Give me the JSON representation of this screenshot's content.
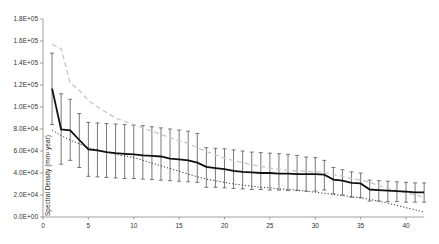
{
  "chart_data": {
    "type": "line",
    "title": "",
    "xlabel": "",
    "ylabel": "Spectral Density (mm² year)",
    "xlim": [
      0,
      42
    ],
    "ylim": [
      0,
      180000
    ],
    "grid": false,
    "legend": null,
    "x_ticks": [
      "0",
      "5",
      "10",
      "15",
      "20",
      "25",
      "30",
      "35",
      "40"
    ],
    "x_tick_values": [
      0,
      5,
      10,
      15,
      20,
      25,
      30,
      35,
      40
    ],
    "y_ticks": [
      "0.0E+00",
      "2.0E+04",
      "4.0E+04",
      "6.0E+04",
      "8.0E+04",
      "1.0E+05",
      "1.2E+05",
      "1.4E+05",
      "1.6E+05",
      "1.8E+05"
    ],
    "y_tick_values": [
      0,
      20000,
      40000,
      60000,
      80000,
      100000,
      120000,
      140000,
      160000,
      180000
    ],
    "x": [
      1,
      2,
      3,
      4,
      5,
      6,
      7,
      8,
      9,
      10,
      11,
      12,
      13,
      14,
      15,
      16,
      17,
      18,
      19,
      20,
      21,
      22,
      23,
      24,
      25,
      26,
      27,
      28,
      29,
      30,
      31,
      32,
      33,
      34,
      35,
      36,
      37,
      38,
      39,
      40,
      41,
      42
    ],
    "series": [
      {
        "name": "mean",
        "style": "solid-black-with-error-bars",
        "values": [
          116700,
          79600,
          78700,
          70000,
          61500,
          60500,
          59000,
          58000,
          57500,
          57000,
          56000,
          55500,
          55000,
          53000,
          52500,
          51500,
          49500,
          45500,
          44500,
          43500,
          42000,
          41000,
          40500,
          40000,
          40000,
          39500,
          39500,
          39000,
          39000,
          39000,
          38500,
          34000,
          33000,
          31000,
          30500,
          25000,
          24500,
          24000,
          23500,
          23000,
          22500,
          22500
        ]
      },
      {
        "name": "upper-bound",
        "style": "dashed-gray",
        "values": [
          157000,
          153000,
          122000,
          115000,
          106000,
          100000,
          95000,
          90000,
          87000,
          84000,
          81000,
          78000,
          75000,
          72000,
          69500,
          67000,
          63000,
          59500,
          56500,
          53500,
          51500,
          49500,
          47500,
          46000,
          44500,
          43500,
          42500,
          42000,
          41500,
          41000,
          40500,
          38500,
          37000,
          35000,
          33500,
          31500,
          28500,
          26000,
          24000,
          22000,
          20000,
          18000
        ]
      },
      {
        "name": "lower-bound",
        "style": "dotted-black",
        "values": [
          79000,
          74000,
          70000,
          66500,
          63000,
          61000,
          59000,
          57000,
          55500,
          54000,
          51500,
          49000,
          46500,
          44000,
          41500,
          39000,
          36500,
          34500,
          33000,
          31500,
          30000,
          29000,
          28000,
          27000,
          26500,
          25500,
          25000,
          24500,
          23500,
          22500,
          21500,
          20500,
          19500,
          18500,
          17500,
          16000,
          14500,
          12500,
          10500,
          8500,
          6500,
          4500
        ]
      },
      {
        "name": "error-bar-top",
        "values": [
          149000,
          112000,
          107000,
          94000,
          86000,
          85500,
          85000,
          84500,
          84000,
          83500,
          83000,
          82000,
          81000,
          80000,
          79000,
          78000,
          76000,
          63000,
          62500,
          62000,
          61000,
          60000,
          59000,
          58500,
          58000,
          57500,
          57000,
          56000,
          54500,
          54000,
          51500,
          45000,
          43000,
          41000,
          40000,
          33500,
          33000,
          32500,
          32000,
          31500,
          31000,
          31000
        ]
      },
      {
        "name": "error-bar-bottom",
        "values": [
          84000,
          48000,
          51500,
          45000,
          37000,
          36500,
          36000,
          35500,
          35000,
          35000,
          34500,
          34000,
          33500,
          33000,
          32500,
          32000,
          31500,
          27000,
          27000,
          26500,
          26000,
          25500,
          25000,
          25000,
          24500,
          24500,
          24000,
          24000,
          23500,
          23500,
          24500,
          21000,
          20000,
          18000,
          17500,
          14500,
          14500,
          14000,
          14000,
          13500,
          13500,
          13500
        ]
      }
    ]
  }
}
